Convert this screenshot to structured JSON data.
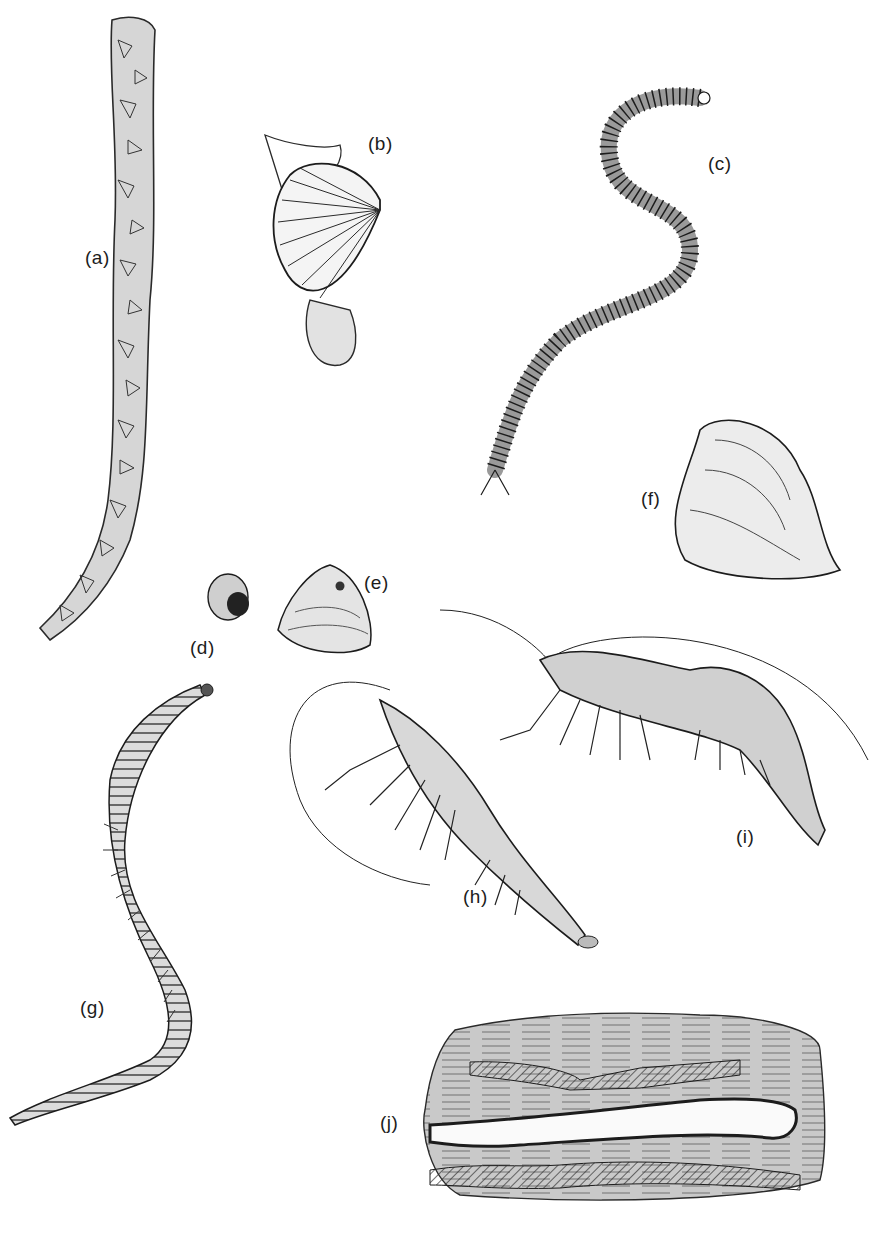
{
  "plate": {
    "background": "#ffffff",
    "ink": "#1c1c1c",
    "shade": "#b8b8b8",
    "figures": [
      {
        "id": "a",
        "label": "(a)",
        "subject": "barnacle-encrusted stem",
        "label_pos": [
          85,
          247
        ]
      },
      {
        "id": "b",
        "label": "(b)",
        "subject": "scallop with byssus/foot",
        "label_pos": [
          368,
          133
        ]
      },
      {
        "id": "c",
        "label": "(c)",
        "subject": "ragworm (segmented bristle worm)",
        "label_pos": [
          708,
          153
        ]
      },
      {
        "id": "d",
        "label": "(d)",
        "subject": "small periwinkle snail",
        "label_pos": [
          190,
          637
        ]
      },
      {
        "id": "e",
        "label": "(e)",
        "subject": "bivalve shell with bore hole",
        "label_pos": [
          364,
          572
        ]
      },
      {
        "id": "f",
        "label": "(f)",
        "subject": "oyster shell",
        "label_pos": [
          641,
          488
        ]
      },
      {
        "id": "g",
        "label": "(g)",
        "subject": "lugworm",
        "label_pos": [
          80,
          997
        ]
      },
      {
        "id": "h",
        "label": "(h)",
        "subject": "prawn",
        "label_pos": [
          463,
          886
        ]
      },
      {
        "id": "i",
        "label": "(i)",
        "subject": "shrimp",
        "label_pos": [
          736,
          826
        ]
      },
      {
        "id": "j",
        "label": "(j)",
        "subject": "shipworm burrows in wood",
        "label_pos": [
          380,
          1112
        ]
      }
    ]
  }
}
